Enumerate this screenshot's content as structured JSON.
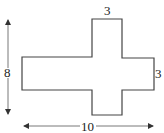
{
  "diagram": {
    "type": "cross-shaped polygon with dimensions",
    "labels": {
      "top_width": "3",
      "right_height": "3",
      "total_height": "8",
      "total_width": "10"
    },
    "colors": {
      "stroke": "#444444",
      "text": "#222222",
      "background": "#ffffff"
    }
  }
}
